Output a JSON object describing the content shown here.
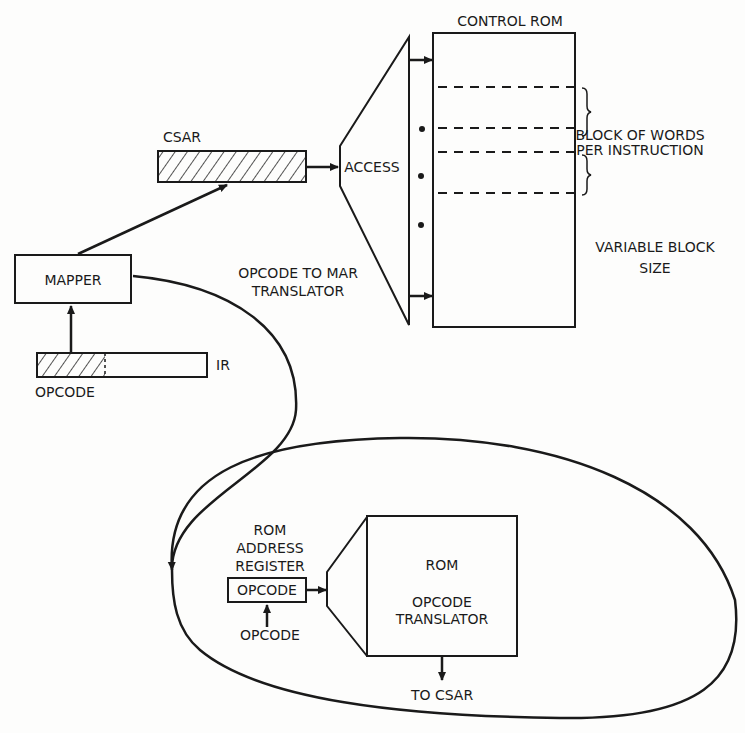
{
  "diagram": {
    "control_rom": {
      "title": "CONTROL ROM"
    },
    "csar": {
      "label": "CSAR"
    },
    "access": {
      "label": "ACCESS"
    },
    "block_note": {
      "line1": "BLOCK OF WORDS",
      "line2": "PER INSTRUCTION"
    },
    "variable_note": {
      "line1": "VARIABLE BLOCK",
      "line2": "SIZE"
    },
    "mapper": {
      "label": "MAPPER"
    },
    "translator_note": {
      "line1": "OPCODE TO MAR",
      "line2": "TRANSLATOR"
    },
    "ir": {
      "label": "IR",
      "field_label": "OPCODE"
    },
    "rom_address_register": {
      "line1": "ROM",
      "line2": "ADDRESS",
      "line3": "REGISTER",
      "field": "OPCODE",
      "input_label": "OPCODE"
    },
    "rom_translator": {
      "line1": "ROM",
      "line2": "OPCODE",
      "line3": "TRANSLATOR",
      "output_label": "TO CSAR"
    },
    "colors": {
      "ink": "#1a1a1a",
      "paper": "#fdfdfc"
    }
  }
}
